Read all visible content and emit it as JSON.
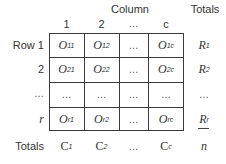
{
  "header": {
    "column_title": "Column",
    "totals_title": "Totals",
    "column_labels": [
      "1",
      "2",
      "…",
      "c"
    ]
  },
  "rows": [
    {
      "label": "Row 1",
      "cells": [
        {
          "base": "O",
          "sub": "11"
        },
        {
          "base": "O",
          "sub": "12"
        },
        {
          "base": "…",
          "sub": ""
        },
        {
          "base": "O",
          "sub": "1c"
        }
      ],
      "total": {
        "base": "R",
        "sub": "1"
      }
    },
    {
      "label": "2",
      "cells": [
        {
          "base": "O",
          "sub": "21"
        },
        {
          "base": "O",
          "sub": "22"
        },
        {
          "base": "…",
          "sub": ""
        },
        {
          "base": "O",
          "sub": "2c"
        }
      ],
      "total": {
        "base": "R",
        "sub": "2"
      }
    },
    {
      "label": "…",
      "cells": [
        {
          "base": "…",
          "sub": ""
        },
        {
          "base": "…",
          "sub": ""
        },
        {
          "base": "…",
          "sub": ""
        },
        {
          "base": "…",
          "sub": ""
        }
      ],
      "total": {
        "base": "…",
        "sub": ""
      }
    },
    {
      "label": "r",
      "cells": [
        {
          "base": "O",
          "sub": "r1"
        },
        {
          "base": "O",
          "sub": "r2"
        },
        {
          "base": "…",
          "sub": ""
        },
        {
          "base": "O",
          "sub": "rc"
        }
      ],
      "total": {
        "base": "R",
        "sub": "r"
      }
    }
  ],
  "footer": {
    "label": "Totals",
    "cells": [
      {
        "base": "C",
        "sub": "1"
      },
      {
        "base": "C",
        "sub": "2"
      },
      {
        "base": "…",
        "sub": ""
      },
      {
        "base": "C",
        "sub": "c"
      }
    ],
    "grand_total": "n"
  }
}
